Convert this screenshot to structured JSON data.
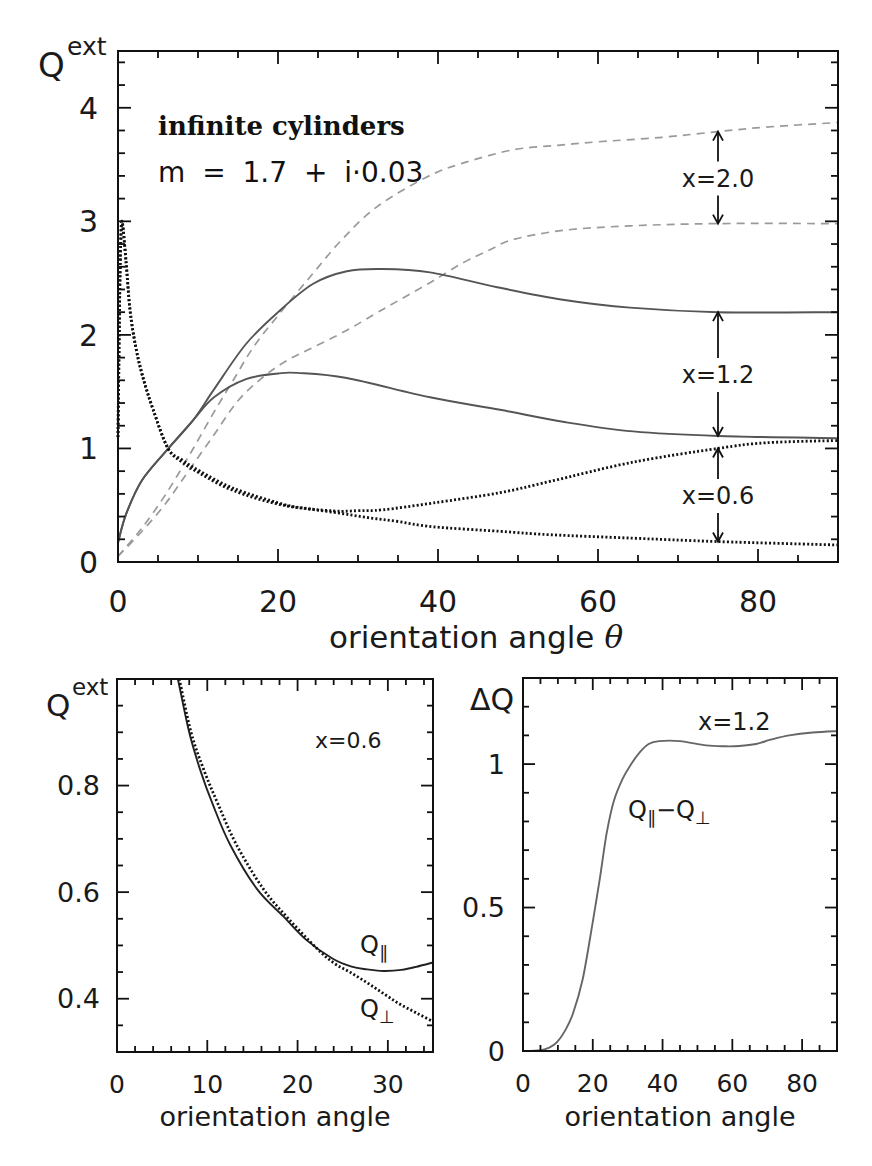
{
  "chart_data": [
    {
      "id": "top",
      "type": "line",
      "title": "",
      "xlabel": {
        "text": "orientation angle",
        "symbol": "θ"
      },
      "ylabel": {
        "base": "Q",
        "sup": "ext"
      },
      "xlim": [
        0,
        90
      ],
      "ylim": [
        0,
        4.5
      ],
      "xticks": [
        0,
        20,
        40,
        60,
        80
      ],
      "xtick_labels": [
        "0",
        "20",
        "40",
        "60",
        "80"
      ],
      "xminor": 5,
      "yticks": [
        0,
        1,
        2,
        3,
        4
      ],
      "ytick_labels": [
        "0",
        "1",
        "2",
        "3",
        "4"
      ],
      "yminor": 0.2,
      "grid": false,
      "legend": "none",
      "text_annotations": [
        "infinite cylinders",
        "m = 1.7 + i·0.03"
      ],
      "arrows": [
        {
          "label": "x=2.0",
          "x": 75,
          "y_upper": 3.79,
          "y_lower": 2.98
        },
        {
          "label": "x=1.2",
          "x": 75,
          "y_upper": 2.2,
          "y_lower": 1.11
        },
        {
          "label": "x=0.6",
          "x": 75,
          "y_upper": 1.0,
          "y_lower": 0.18
        }
      ],
      "series": [
        {
          "name": "x=2.0 upper",
          "style": "dashed",
          "color": "#9a9a9a",
          "points": [
            [
              0,
              0.05
            ],
            [
              3,
              0.3
            ],
            [
              6,
              0.6
            ],
            [
              9,
              0.95
            ],
            [
              12,
              1.32
            ],
            [
              14.4,
              1.6
            ],
            [
              17,
              1.9
            ],
            [
              20,
              2.17
            ],
            [
              24,
              2.51
            ],
            [
              28,
              2.84
            ],
            [
              32.4,
              3.13
            ],
            [
              38.6,
              3.39
            ],
            [
              43,
              3.51
            ],
            [
              49.4,
              3.63
            ],
            [
              55,
              3.67
            ],
            [
              60,
              3.7
            ],
            [
              68,
              3.74
            ],
            [
              75,
              3.79
            ],
            [
              81,
              3.83
            ],
            [
              90,
              3.87
            ]
          ]
        },
        {
          "name": "x=2.0 lower",
          "style": "dashed",
          "color": "#9a9a9a",
          "points": [
            [
              0,
              0.05
            ],
            [
              3,
              0.27
            ],
            [
              6,
              0.52
            ],
            [
              9,
              0.82
            ],
            [
              12,
              1.12
            ],
            [
              15,
              1.42
            ],
            [
              18,
              1.62
            ],
            [
              21,
              1.77
            ],
            [
              24.4,
              1.89
            ],
            [
              28.6,
              2.04
            ],
            [
              32,
              2.18
            ],
            [
              35,
              2.3
            ],
            [
              39,
              2.46
            ],
            [
              43,
              2.63
            ],
            [
              46.5,
              2.75
            ],
            [
              49.4,
              2.84
            ],
            [
              55.6,
              2.92
            ],
            [
              64,
              2.96
            ],
            [
              75,
              2.98
            ],
            [
              90,
              2.98
            ]
          ]
        },
        {
          "name": "x=1.2 Q∥",
          "style": "solid",
          "color": "#555555",
          "points": [
            [
              0,
              0.17
            ],
            [
              1,
              0.42
            ],
            [
              3,
              0.72
            ],
            [
              6.3,
              1.0
            ],
            [
              9.4,
              1.25
            ],
            [
              12,
              1.52
            ],
            [
              16,
              1.92
            ],
            [
              20,
              2.2
            ],
            [
              24.4,
              2.45
            ],
            [
              28.6,
              2.56
            ],
            [
              33,
              2.58
            ],
            [
              39,
              2.55
            ],
            [
              47.4,
              2.42
            ],
            [
              55.6,
              2.31
            ],
            [
              64,
              2.24
            ],
            [
              75,
              2.2
            ],
            [
              90,
              2.2
            ]
          ]
        },
        {
          "name": "x=1.2 Q⊥",
          "style": "solid",
          "color": "#555555",
          "points": [
            [
              0,
              0.17
            ],
            [
              1,
              0.42
            ],
            [
              3,
              0.72
            ],
            [
              6.3,
              1.0
            ],
            [
              9.4,
              1.25
            ],
            [
              12,
              1.45
            ],
            [
              16,
              1.61
            ],
            [
              20,
              1.66
            ],
            [
              22.4,
              1.665
            ],
            [
              28.6,
              1.62
            ],
            [
              39,
              1.45
            ],
            [
              47.75,
              1.34
            ],
            [
              56,
              1.23
            ],
            [
              64.4,
              1.15
            ],
            [
              75,
              1.11
            ],
            [
              90,
              1.09
            ]
          ]
        },
        {
          "name": "x=0.6 Q∥",
          "style": "dotted",
          "color": "#111111",
          "points": [
            [
              0,
              1.1
            ],
            [
              0.15,
              2.0
            ],
            [
              0.3,
              2.7
            ],
            [
              0.5,
              3.0
            ],
            [
              1.0,
              2.65
            ],
            [
              1.5,
              2.22
            ],
            [
              2.2,
              1.9
            ],
            [
              3.1,
              1.63
            ],
            [
              4.4,
              1.34
            ],
            [
              6.25,
              1.0
            ],
            [
              8,
              0.88
            ],
            [
              10.25,
              0.78
            ],
            [
              14.4,
              0.63
            ],
            [
              20.6,
              0.5
            ],
            [
              26.9,
              0.45
            ],
            [
              30,
              0.452
            ],
            [
              33.1,
              0.46
            ],
            [
              39.4,
              0.52
            ],
            [
              47.75,
              0.61
            ],
            [
              54,
              0.71
            ],
            [
              64.4,
              0.88
            ],
            [
              75,
              1.0
            ],
            [
              81,
              1.05
            ],
            [
              90,
              1.07
            ]
          ]
        },
        {
          "name": "x=0.6 Q⊥",
          "style": "dotted",
          "color": "#111111",
          "points": [
            [
              0,
              1.1
            ],
            [
              0.15,
              2.0
            ],
            [
              0.3,
              2.7
            ],
            [
              0.5,
              3.0
            ],
            [
              1.0,
              2.65
            ],
            [
              1.5,
              2.22
            ],
            [
              2.2,
              1.9
            ],
            [
              3.1,
              1.63
            ],
            [
              4.4,
              1.34
            ],
            [
              6.25,
              1.0
            ],
            [
              8,
              0.9
            ],
            [
              10.25,
              0.8
            ],
            [
              14.4,
              0.65
            ],
            [
              20.6,
              0.51
            ],
            [
              24,
              0.467
            ],
            [
              27.7,
              0.43
            ],
            [
              31.3,
              0.39
            ],
            [
              35,
              0.357
            ],
            [
              39.4,
              0.31
            ],
            [
              47.75,
              0.27
            ],
            [
              54,
              0.24
            ],
            [
              64.4,
              0.21
            ],
            [
              75,
              0.18
            ],
            [
              90,
              0.15
            ]
          ]
        }
      ]
    },
    {
      "id": "bl",
      "type": "line",
      "title": "",
      "xlabel": {
        "text": "orientation angle"
      },
      "ylabel": {
        "base": "Q",
        "sup": "ext"
      },
      "xlim": [
        0,
        35
      ],
      "ylim": [
        0.3,
        1.0
      ],
      "xticks": [
        0,
        10,
        20,
        30
      ],
      "xtick_labels": [
        "0",
        "10",
        "20",
        "30"
      ],
      "xminor": 2,
      "yticks": [
        0.4,
        0.6,
        0.8
      ],
      "ytick_labels": [
        "0.4",
        "0.6",
        "0.8"
      ],
      "yminor": 0.05,
      "grid": false,
      "legend": "none",
      "text_annotations": [
        "x=0.6",
        {
          "parts": [
            {
              "text": "Q"
            },
            {
              "text": "∥",
              "sub": true
            }
          ]
        },
        {
          "parts": [
            {
              "text": "Q"
            },
            {
              "text": "⊥",
              "sub": true
            }
          ]
        }
      ],
      "series": [
        {
          "name": "Q∥",
          "style": "solid",
          "color": "#222222",
          "points": [
            [
              6.75,
              1.0
            ],
            [
              8,
              0.9
            ],
            [
              9.2,
              0.83
            ],
            [
              10.6,
              0.765
            ],
            [
              12.5,
              0.69
            ],
            [
              15.5,
              0.606
            ],
            [
              18.4,
              0.555
            ],
            [
              21,
              0.51
            ],
            [
              23.9,
              0.475
            ],
            [
              26,
              0.46
            ],
            [
              27.7,
              0.455
            ],
            [
              29.5,
              0.452
            ],
            [
              31.5,
              0.454
            ],
            [
              33.2,
              0.46
            ],
            [
              35,
              0.468
            ]
          ]
        },
        {
          "name": "Q⊥",
          "style": "dotted",
          "color": "#111111",
          "points": [
            [
              6.9,
              1.0
            ],
            [
              8.2,
              0.9
            ],
            [
              9.6,
              0.83
            ],
            [
              11.2,
              0.765
            ],
            [
              13.2,
              0.69
            ],
            [
              16.2,
              0.606
            ],
            [
              19,
              0.55
            ],
            [
              22.1,
              0.495
            ],
            [
              24,
              0.467
            ],
            [
              25.8,
              0.45
            ],
            [
              27.7,
              0.43
            ],
            [
              29.5,
              0.41
            ],
            [
              31.3,
              0.39
            ],
            [
              33.2,
              0.373
            ],
            [
              35,
              0.357
            ]
          ]
        }
      ]
    },
    {
      "id": "br",
      "type": "line",
      "title": "",
      "xlabel": {
        "text": "orientation angle"
      },
      "ylabel": {
        "base": "ΔQ"
      },
      "xlim": [
        0,
        90
      ],
      "ylim": [
        0,
        1.3
      ],
      "xticks": [
        0,
        20,
        40,
        60,
        80
      ],
      "xtick_labels": [
        "0",
        "20",
        "40",
        "60",
        "80"
      ],
      "xminor": 5,
      "yticks": [
        0,
        0.5,
        1
      ],
      "ytick_labels": [
        "0",
        "0.5",
        "1"
      ],
      "yminor": 0.1,
      "grid": false,
      "legend": "none",
      "text_annotations": [
        "x=1.2",
        {
          "parts": [
            {
              "text": "Q"
            },
            {
              "text": "∥",
              "sub": true
            },
            {
              "text": "−Q"
            },
            {
              "text": "⊥",
              "sub": true
            }
          ]
        }
      ],
      "series": [
        {
          "name": "Q∥−Q⊥",
          "style": "solid",
          "color": "#666666",
          "points": [
            [
              0,
              0
            ],
            [
              5,
              0.003
            ],
            [
              7.5,
              0.012
            ],
            [
              9.7,
              0.03
            ],
            [
              12,
              0.07
            ],
            [
              14.3,
              0.13
            ],
            [
              17.1,
              0.25
            ],
            [
              20,
              0.45
            ],
            [
              22,
              0.6
            ],
            [
              24,
              0.76
            ],
            [
              26,
              0.87
            ],
            [
              28.6,
              0.95
            ],
            [
              31,
              1.0
            ],
            [
              33.4,
              1.04
            ],
            [
              36,
              1.07
            ],
            [
              39,
              1.08
            ],
            [
              45,
              1.08
            ],
            [
              52.5,
              1.065
            ],
            [
              58,
              1.062
            ],
            [
              62,
              1.063
            ],
            [
              66.8,
              1.07
            ],
            [
              71,
              1.085
            ],
            [
              76.3,
              1.1
            ],
            [
              83,
              1.11
            ],
            [
              90,
              1.115
            ]
          ]
        }
      ]
    }
  ]
}
